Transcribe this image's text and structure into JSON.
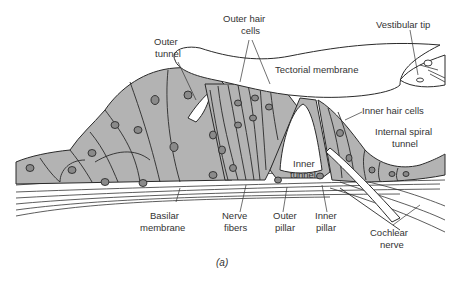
{
  "figure": {
    "caption": "(a)",
    "colors": {
      "tissue": "#b3b3b3",
      "nucleus": "#8a8a8a",
      "outline": "#2a2a2a",
      "background": "#ffffff"
    }
  },
  "labels": {
    "outer_tunnel": [
      "Outer",
      "tunnel"
    ],
    "outer_hair_cells": [
      "Outer hair",
      "cells"
    ],
    "vestibular_tip": "Vestibular tip",
    "tectorial_membrane": "Tectorial membrane",
    "inner_hair_cells": "Inner hair cells",
    "internal_spiral_tunnel": [
      "Internal spiral",
      "tunnel"
    ],
    "inner_tunnel": [
      "Inner",
      "tunnel"
    ],
    "basilar_membrane": [
      "Basilar",
      "membrane"
    ],
    "nerve_fibers": [
      "Nerve",
      "fibers"
    ],
    "outer_pillar": [
      "Outer",
      "pillar"
    ],
    "inner_pillar": [
      "Inner",
      "pillar"
    ],
    "cochlear_nerve": [
      "Cochlear",
      "nerve"
    ]
  }
}
